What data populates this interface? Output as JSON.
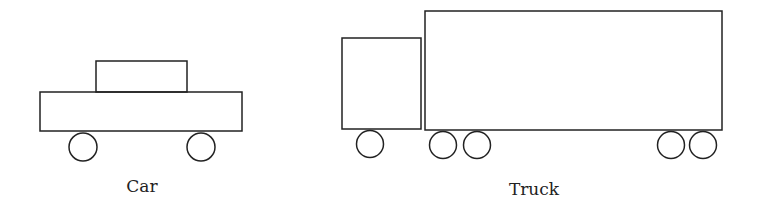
{
  "diagram": {
    "stroke_color": "#222222",
    "background": "#ffffff",
    "car": {
      "label": "Car",
      "cabin": {
        "x": 96,
        "y": 61,
        "w": 91,
        "h": 31
      },
      "body": {
        "x": 40,
        "y": 92,
        "w": 202,
        "h": 39
      },
      "wheels": [
        {
          "cx": 83,
          "cy": 147,
          "r": 14
        },
        {
          "cx": 201,
          "cy": 147,
          "r": 14
        }
      ]
    },
    "truck": {
      "label": "Truck",
      "cab": {
        "x": 342,
        "y": 38,
        "w": 79,
        "h": 91
      },
      "trailer": {
        "x": 425,
        "y": 11,
        "w": 297,
        "h": 119
      },
      "wheels": [
        {
          "cx": 370,
          "cy": 144,
          "r": 13.5
        },
        {
          "cx": 443,
          "cy": 145,
          "r": 13.5
        },
        {
          "cx": 477,
          "cy": 145,
          "r": 13.5
        },
        {
          "cx": 671,
          "cy": 145,
          "r": 13.5
        },
        {
          "cx": 703,
          "cy": 145,
          "r": 13.5
        }
      ]
    }
  }
}
